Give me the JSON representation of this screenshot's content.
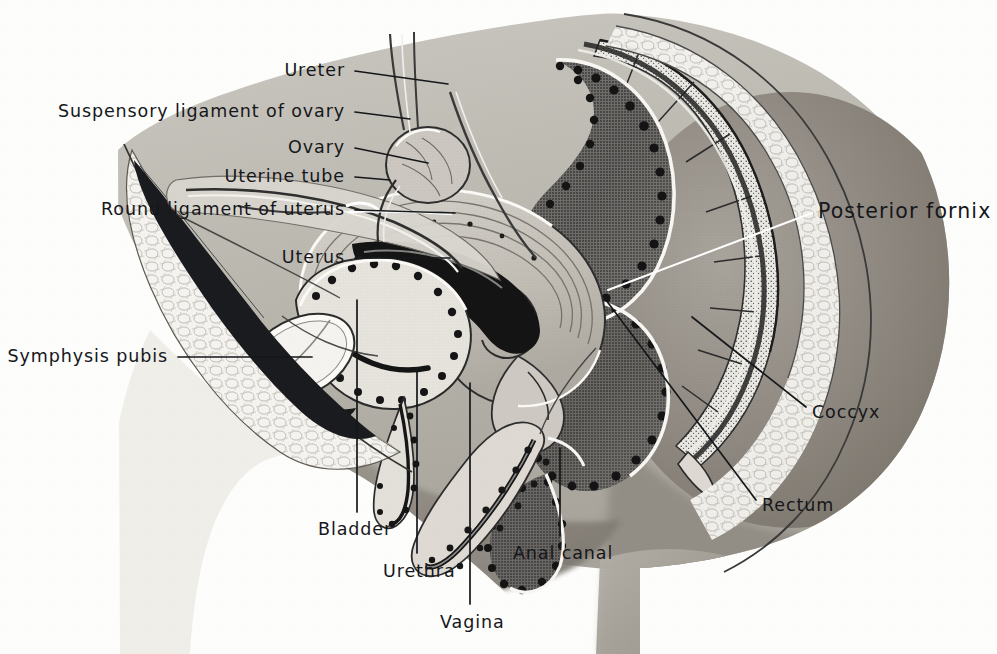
{
  "figure": {
    "background_color": "#fdfdfb",
    "ink_color": "#15171a",
    "width": 997,
    "height": 654
  },
  "labels": [
    {
      "id": "ureter",
      "text": "Ureter",
      "align": "right",
      "x": 345,
      "y": 71,
      "leader": [
        [
          355,
          71
        ],
        [
          448,
          84
        ]
      ]
    },
    {
      "id": "suspensory",
      "text": "Suspensory ligament of ovary",
      "align": "right",
      "x": 345,
      "y": 112,
      "leader": [
        [
          355,
          112
        ],
        [
          410,
          119
        ]
      ]
    },
    {
      "id": "ovary",
      "text": "Ovary",
      "align": "right",
      "x": 345,
      "y": 148,
      "leader": [
        [
          355,
          148
        ],
        [
          428,
          163
        ]
      ]
    },
    {
      "id": "uterine-tube",
      "text": "Uterine tube",
      "align": "right",
      "x": 345,
      "y": 177,
      "leader": [
        [
          355,
          177
        ],
        [
          390,
          180
        ]
      ]
    },
    {
      "id": "round-ligament",
      "text": "Round ligament of uterus",
      "align": "right",
      "x": 345,
      "y": 210,
      "leader": [
        [
          355,
          210
        ],
        [
          455,
          213
        ]
      ]
    },
    {
      "id": "uterus",
      "text": "Uterus",
      "align": "right",
      "x": 345,
      "y": 258,
      "leader": [
        [
          355,
          258
        ],
        [
          450,
          258
        ]
      ]
    },
    {
      "id": "symphysis-pubis",
      "text": "Symphysis pubis",
      "align": "right",
      "x": 168,
      "y": 357,
      "leader": [
        [
          178,
          357
        ],
        [
          312,
          357
        ]
      ]
    },
    {
      "id": "posterior-fornix",
      "text": "Posterior fornix",
      "align": "left",
      "x": 818,
      "y": 211,
      "size": "big",
      "leader": [
        [
          812,
          213
        ],
        [
          608,
          290
        ]
      ],
      "stroke": "#ffffff"
    },
    {
      "id": "coccyx",
      "text": "Coccyx",
      "align": "left",
      "x": 812,
      "y": 413,
      "leader": [
        [
          806,
          407
        ],
        [
          692,
          317
        ]
      ]
    },
    {
      "id": "rectum",
      "text": "Rectum",
      "align": "left",
      "x": 762,
      "y": 506,
      "leader": [
        [
          756,
          500
        ],
        [
          606,
          300
        ]
      ]
    },
    {
      "id": "bladder",
      "text": "Bladder",
      "align": "left",
      "x": 318,
      "y": 530,
      "leader": [
        [
          357,
          512
        ],
        [
          357,
          300
        ]
      ]
    },
    {
      "id": "urethra",
      "text": "Urethra",
      "align": "left",
      "x": 383,
      "y": 572,
      "leader": [
        [
          417,
          553
        ],
        [
          417,
          368
        ]
      ]
    },
    {
      "id": "vagina",
      "text": "Vagina",
      "align": "left",
      "x": 440,
      "y": 623,
      "leader": [
        [
          470,
          604
        ],
        [
          470,
          383
        ]
      ]
    },
    {
      "id": "anal-canal",
      "text": "Anal canal",
      "align": "left",
      "x": 513,
      "y": 554,
      "leader": [
        [
          560,
          536
        ],
        [
          560,
          448
        ]
      ]
    }
  ]
}
